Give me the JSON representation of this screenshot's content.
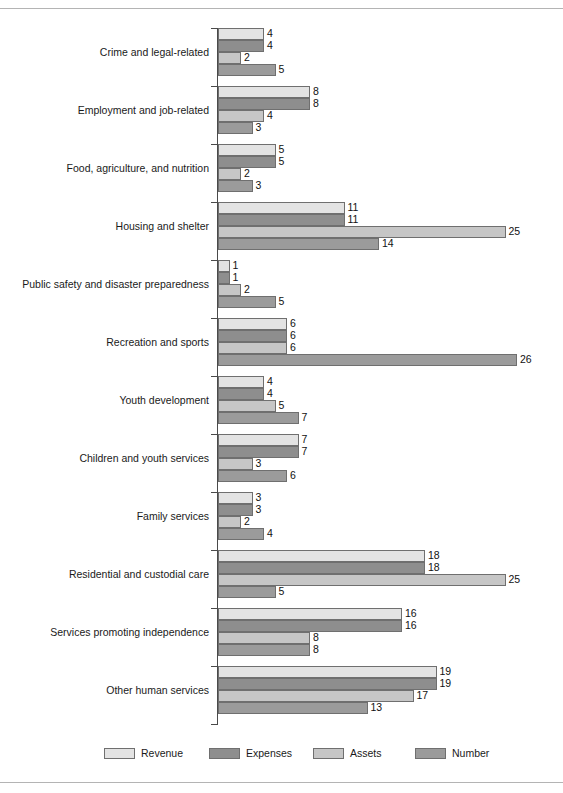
{
  "chart_data": {
    "type": "bar",
    "orientation": "horizontal",
    "title": "",
    "subtitle": "",
    "xlabel": "",
    "ylabel": "",
    "grid": false,
    "legend_position": "bottom",
    "xlim": [
      0,
      26
    ],
    "axis_visible": true,
    "value_labels": true,
    "categories": [
      "Crime and legal-related",
      "Employment and job-related",
      "Food, agriculture, and nutrition",
      "Housing and shelter",
      "Public safety and disaster preparedness",
      "Recreation and sports",
      "Youth development",
      "Children and youth services",
      "Family services",
      "Residential and custodial care",
      "Services promoting independence",
      "Other human services"
    ],
    "series": [
      {
        "name": "Revenue",
        "color": "#e3e3e3",
        "values": [
          4,
          8,
          5,
          11,
          1,
          6,
          4,
          7,
          3,
          18,
          16,
          19
        ]
      },
      {
        "name": "Expenses",
        "color": "#8e8e8e",
        "values": [
          4,
          8,
          5,
          11,
          1,
          6,
          4,
          7,
          3,
          18,
          16,
          19
        ]
      },
      {
        "name": "Assets",
        "color": "#c6c6c6",
        "values": [
          2,
          4,
          2,
          25,
          2,
          6,
          5,
          3,
          2,
          25,
          8,
          17
        ]
      },
      {
        "name": "Number",
        "color": "#9b9b9b",
        "values": [
          5,
          3,
          3,
          14,
          5,
          26,
          7,
          6,
          4,
          5,
          8,
          13
        ]
      }
    ]
  },
  "legend": {
    "items": [
      {
        "label": "Revenue",
        "color": "#e3e3e3"
      },
      {
        "label": "Expenses",
        "color": "#8e8e8e"
      },
      {
        "label": "Assets",
        "color": "#c6c6c6"
      },
      {
        "label": "Number",
        "color": "#9b9b9b"
      }
    ]
  }
}
